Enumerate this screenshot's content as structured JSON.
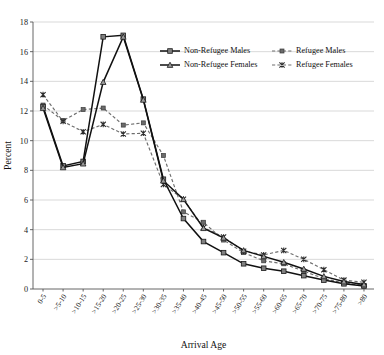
{
  "chart_data": {
    "type": "line",
    "title": "",
    "xlabel": "Arrival Age",
    "ylabel": "Percent",
    "ylim": [
      0,
      18
    ],
    "yticks": [
      0,
      2,
      4,
      6,
      8,
      10,
      12,
      14,
      16,
      18
    ],
    "grid": true,
    "legend_position": "top-right-inside",
    "categories": [
      "0-5",
      ">5-10",
      ">10-15",
      ">15-20",
      ">20-25",
      ">25-30",
      ">30-35",
      ">35-40",
      ">40-45",
      ">45-50",
      ">50-55",
      ">55-60",
      ">60-65",
      ">65-70",
      ">70-75",
      ">75-80",
      ">80"
    ],
    "series": [
      {
        "name": "Non-Refugee Males",
        "style": "solid",
        "marker": "square",
        "color": "#111111",
        "values": [
          12.3,
          8.3,
          8.6,
          17.0,
          17.1,
          12.8,
          7.4,
          4.75,
          3.2,
          2.45,
          1.7,
          1.4,
          1.2,
          0.9,
          0.6,
          0.35,
          0.2
        ]
      },
      {
        "name": "Non-Refugee Females",
        "style": "solid",
        "marker": "triangle",
        "color": "#111111",
        "values": [
          12.2,
          8.2,
          8.45,
          13.95,
          17.0,
          12.75,
          7.3,
          6.05,
          4.1,
          3.45,
          2.6,
          2.2,
          1.8,
          1.35,
          0.85,
          0.5,
          0.3
        ]
      },
      {
        "name": "Refugee Males",
        "style": "dashed",
        "marker": "square",
        "color": "#6e6e6e",
        "values": [
          12.4,
          11.35,
          12.1,
          12.2,
          11.05,
          11.2,
          9.0,
          5.2,
          4.5,
          3.3,
          2.45,
          1.9,
          1.7,
          1.2,
          0.7,
          0.4,
          0.25
        ]
      },
      {
        "name": "Refugee Females",
        "style": "dashed",
        "marker": "x",
        "color": "#2b2b2b",
        "values": [
          13.1,
          11.3,
          10.6,
          11.1,
          10.45,
          10.5,
          7.05,
          6.05,
          4.15,
          3.5,
          2.55,
          2.3,
          2.6,
          2.0,
          1.3,
          0.6,
          0.45
        ]
      }
    ]
  },
  "axes": {
    "y_label": "Percent",
    "x_label": "Arrival Age",
    "y_tick_labels": [
      "0",
      "2",
      "4",
      "6",
      "8",
      "10",
      "12",
      "14",
      "16",
      "18"
    ]
  },
  "legend": {
    "entries": [
      {
        "label": "Non-Refugee Males",
        "style": "solid",
        "marker": "square"
      },
      {
        "label": "Refugee Males",
        "style": "dashed",
        "marker": "square"
      },
      {
        "label": "Non-Refugee Females",
        "style": "solid",
        "marker": "triangle"
      },
      {
        "label": "Refugee Females",
        "style": "dashed",
        "marker": "x"
      }
    ]
  }
}
